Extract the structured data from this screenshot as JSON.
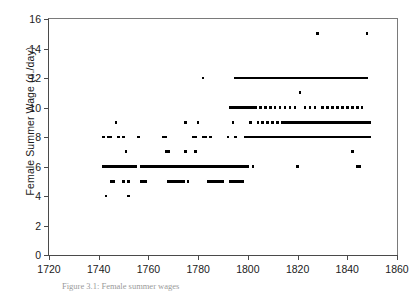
{
  "chart_data": {
    "type": "scatter",
    "title": "",
    "xlabel": "",
    "ylabel": "Female Summer Wage (d./day)",
    "xlim": [
      1720,
      1860
    ],
    "ylim": [
      0,
      16
    ],
    "xticks": [
      1720,
      1740,
      1760,
      1780,
      1800,
      1820,
      1840,
      1860
    ],
    "yticks": [
      0,
      2,
      4,
      6,
      8,
      10,
      12,
      14,
      16
    ],
    "grid": false,
    "legend": null,
    "marker": "square",
    "marker_color": "#000000",
    "points": [
      [
        1742,
        8
      ],
      [
        1742,
        6
      ],
      [
        1743,
        6
      ],
      [
        1743,
        4
      ],
      [
        1744,
        6
      ],
      [
        1744,
        8
      ],
      [
        1745,
        6
      ],
      [
        1745,
        8
      ],
      [
        1745,
        5
      ],
      [
        1746,
        6
      ],
      [
        1746,
        5
      ],
      [
        1747,
        6
      ],
      [
        1747,
        9
      ],
      [
        1748,
        6
      ],
      [
        1748,
        8
      ],
      [
        1749,
        6
      ],
      [
        1750,
        6
      ],
      [
        1750,
        8
      ],
      [
        1750,
        5
      ],
      [
        1751,
        6
      ],
      [
        1751,
        7
      ],
      [
        1752,
        6
      ],
      [
        1752,
        4
      ],
      [
        1752,
        5
      ],
      [
        1753,
        6
      ],
      [
        1754,
        6
      ],
      [
        1755,
        6
      ],
      [
        1756,
        8
      ],
      [
        1757,
        6
      ],
      [
        1757,
        5
      ],
      [
        1758,
        6
      ],
      [
        1758,
        5
      ],
      [
        1759,
        6
      ],
      [
        1759,
        5
      ],
      [
        1760,
        6
      ],
      [
        1761,
        6
      ],
      [
        1762,
        6
      ],
      [
        1763,
        6
      ],
      [
        1764,
        6
      ],
      [
        1765,
        6
      ],
      [
        1766,
        8
      ],
      [
        1766,
        6
      ],
      [
        1767,
        8
      ],
      [
        1767,
        7
      ],
      [
        1767,
        6
      ],
      [
        1768,
        7
      ],
      [
        1768,
        6
      ],
      [
        1768,
        5
      ],
      [
        1769,
        6
      ],
      [
        1769,
        5
      ],
      [
        1770,
        6
      ],
      [
        1770,
        5
      ],
      [
        1771,
        5
      ],
      [
        1771,
        6
      ],
      [
        1772,
        5
      ],
      [
        1772,
        6
      ],
      [
        1773,
        5
      ],
      [
        1773,
        6
      ],
      [
        1774,
        5
      ],
      [
        1774,
        6
      ],
      [
        1775,
        7
      ],
      [
        1775,
        9
      ],
      [
        1775,
        6
      ],
      [
        1776,
        6
      ],
      [
        1776,
        5
      ],
      [
        1777,
        6
      ],
      [
        1777,
        6
      ],
      [
        1778,
        8
      ],
      [
        1778,
        6
      ],
      [
        1779,
        8
      ],
      [
        1779,
        7
      ],
      [
        1779,
        6
      ],
      [
        1780,
        9
      ],
      [
        1780,
        6
      ],
      [
        1780,
        6
      ],
      [
        1781,
        6
      ],
      [
        1781,
        6
      ],
      [
        1782,
        12
      ],
      [
        1782,
        8
      ],
      [
        1782,
        6
      ],
      [
        1783,
        8
      ],
      [
        1783,
        6
      ],
      [
        1784,
        6
      ],
      [
        1784,
        5
      ],
      [
        1785,
        8
      ],
      [
        1785,
        6
      ],
      [
        1785,
        5
      ],
      [
        1786,
        6
      ],
      [
        1786,
        5
      ],
      [
        1787,
        6
      ],
      [
        1787,
        5
      ],
      [
        1788,
        6
      ],
      [
        1788,
        5
      ],
      [
        1789,
        6
      ],
      [
        1789,
        5
      ],
      [
        1790,
        6
      ],
      [
        1790,
        5
      ],
      [
        1791,
        6
      ],
      [
        1792,
        8
      ],
      [
        1792,
        6
      ],
      [
        1793,
        10
      ],
      [
        1793,
        6
      ],
      [
        1793,
        5
      ],
      [
        1794,
        10
      ],
      [
        1794,
        9
      ],
      [
        1794,
        6
      ],
      [
        1794,
        5
      ],
      [
        1795,
        12
      ],
      [
        1795,
        10
      ],
      [
        1795,
        8
      ],
      [
        1795,
        6
      ],
      [
        1795,
        5
      ],
      [
        1796,
        12
      ],
      [
        1796,
        10
      ],
      [
        1796,
        6
      ],
      [
        1796,
        5
      ],
      [
        1797,
        12
      ],
      [
        1797,
        10
      ],
      [
        1797,
        6
      ],
      [
        1797,
        5
      ],
      [
        1798,
        12
      ],
      [
        1798,
        10
      ],
      [
        1798,
        6
      ],
      [
        1798,
        5
      ],
      [
        1799,
        12
      ],
      [
        1799,
        10
      ],
      [
        1799,
        8
      ],
      [
        1799,
        6
      ],
      [
        1800,
        12
      ],
      [
        1800,
        10
      ],
      [
        1800,
        8
      ],
      [
        1800,
        6
      ],
      [
        1801,
        12
      ],
      [
        1801,
        10
      ],
      [
        1801,
        9
      ],
      [
        1801,
        8
      ],
      [
        1802,
        12
      ],
      [
        1802,
        10
      ],
      [
        1802,
        8
      ],
      [
        1802,
        6
      ],
      [
        1803,
        12
      ],
      [
        1803,
        10
      ],
      [
        1803,
        8
      ],
      [
        1804,
        12
      ],
      [
        1804,
        9
      ],
      [
        1804,
        8
      ],
      [
        1805,
        12
      ],
      [
        1805,
        10
      ],
      [
        1805,
        8
      ],
      [
        1806,
        12
      ],
      [
        1806,
        9
      ],
      [
        1806,
        8
      ],
      [
        1807,
        12
      ],
      [
        1807,
        10
      ],
      [
        1807,
        8
      ],
      [
        1808,
        12
      ],
      [
        1808,
        9
      ],
      [
        1808,
        8
      ],
      [
        1809,
        12
      ],
      [
        1809,
        10
      ],
      [
        1809,
        8
      ],
      [
        1810,
        12
      ],
      [
        1810,
        9
      ],
      [
        1810,
        8
      ],
      [
        1811,
        12
      ],
      [
        1811,
        10
      ],
      [
        1811,
        8
      ],
      [
        1812,
        12
      ],
      [
        1812,
        9
      ],
      [
        1812,
        8
      ],
      [
        1813,
        12
      ],
      [
        1813,
        10
      ],
      [
        1813,
        8
      ],
      [
        1814,
        12
      ],
      [
        1814,
        9
      ],
      [
        1814,
        8
      ],
      [
        1815,
        12
      ],
      [
        1815,
        10
      ],
      [
        1815,
        9
      ],
      [
        1815,
        8
      ],
      [
        1816,
        12
      ],
      [
        1816,
        9
      ],
      [
        1816,
        8
      ],
      [
        1817,
        12
      ],
      [
        1817,
        10
      ],
      [
        1817,
        9
      ],
      [
        1817,
        8
      ],
      [
        1818,
        12
      ],
      [
        1818,
        9
      ],
      [
        1818,
        8
      ],
      [
        1819,
        12
      ],
      [
        1819,
        10
      ],
      [
        1819,
        9
      ],
      [
        1819,
        8
      ],
      [
        1820,
        12
      ],
      [
        1820,
        9
      ],
      [
        1820,
        6
      ],
      [
        1820,
        8
      ],
      [
        1821,
        12
      ],
      [
        1821,
        11
      ],
      [
        1821,
        9
      ],
      [
        1821,
        8
      ],
      [
        1822,
        12
      ],
      [
        1822,
        9
      ],
      [
        1822,
        8
      ],
      [
        1823,
        12
      ],
      [
        1823,
        10
      ],
      [
        1823,
        9
      ],
      [
        1823,
        8
      ],
      [
        1824,
        12
      ],
      [
        1824,
        9
      ],
      [
        1824,
        8
      ],
      [
        1825,
        12
      ],
      [
        1825,
        10
      ],
      [
        1825,
        9
      ],
      [
        1825,
        8
      ],
      [
        1826,
        12
      ],
      [
        1826,
        9
      ],
      [
        1826,
        8
      ],
      [
        1827,
        12
      ],
      [
        1827,
        10
      ],
      [
        1827,
        9
      ],
      [
        1827,
        8
      ],
      [
        1828,
        15
      ],
      [
        1828,
        12
      ],
      [
        1828,
        9
      ],
      [
        1828,
        8
      ],
      [
        1829,
        12
      ],
      [
        1829,
        9
      ],
      [
        1829,
        8
      ],
      [
        1830,
        12
      ],
      [
        1830,
        10
      ],
      [
        1830,
        9
      ],
      [
        1830,
        8
      ],
      [
        1831,
        12
      ],
      [
        1831,
        9
      ],
      [
        1831,
        8
      ],
      [
        1832,
        12
      ],
      [
        1832,
        10
      ],
      [
        1832,
        9
      ],
      [
        1832,
        8
      ],
      [
        1833,
        12
      ],
      [
        1833,
        9
      ],
      [
        1833,
        8
      ],
      [
        1834,
        12
      ],
      [
        1834,
        10
      ],
      [
        1834,
        9
      ],
      [
        1834,
        8
      ],
      [
        1835,
        12
      ],
      [
        1835,
        9
      ],
      [
        1835,
        8
      ],
      [
        1836,
        12
      ],
      [
        1836,
        10
      ],
      [
        1836,
        9
      ],
      [
        1836,
        8
      ],
      [
        1837,
        12
      ],
      [
        1837,
        9
      ],
      [
        1837,
        8
      ],
      [
        1838,
        12
      ],
      [
        1838,
        10
      ],
      [
        1838,
        9
      ],
      [
        1838,
        8
      ],
      [
        1839,
        12
      ],
      [
        1839,
        9
      ],
      [
        1839,
        8
      ],
      [
        1840,
        12
      ],
      [
        1840,
        10
      ],
      [
        1840,
        9
      ],
      [
        1840,
        8
      ],
      [
        1841,
        12
      ],
      [
        1841,
        9
      ],
      [
        1841,
        8
      ],
      [
        1842,
        12
      ],
      [
        1842,
        10
      ],
      [
        1842,
        9
      ],
      [
        1842,
        8
      ],
      [
        1842,
        7
      ],
      [
        1843,
        12
      ],
      [
        1843,
        9
      ],
      [
        1843,
        8
      ],
      [
        1844,
        12
      ],
      [
        1844,
        10
      ],
      [
        1844,
        9
      ],
      [
        1844,
        8
      ],
      [
        1844,
        6
      ],
      [
        1845,
        12
      ],
      [
        1845,
        9
      ],
      [
        1845,
        8
      ],
      [
        1845,
        6
      ],
      [
        1846,
        12
      ],
      [
        1846,
        10
      ],
      [
        1846,
        9
      ],
      [
        1846,
        8
      ],
      [
        1847,
        12
      ],
      [
        1847,
        9
      ],
      [
        1847,
        8
      ],
      [
        1848,
        15
      ],
      [
        1848,
        12
      ],
      [
        1848,
        9
      ],
      [
        1848,
        8
      ],
      [
        1849,
        9
      ],
      [
        1849,
        8
      ]
    ]
  },
  "caption": "Figure 3.1: Female summer wages",
  "axis": {
    "line_color": "#4a4a4a",
    "tick_color": "#4a4a4a",
    "text_color": "#1a1a1a"
  }
}
